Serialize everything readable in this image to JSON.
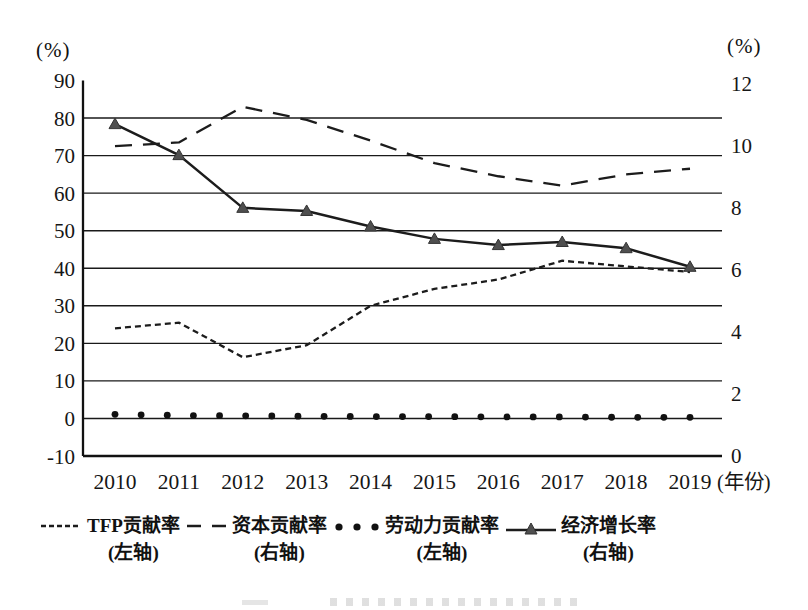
{
  "left_axis": {
    "unit": "(%)",
    "ticks": [
      90,
      80,
      70,
      60,
      50,
      40,
      30,
      20,
      10,
      0,
      -10
    ]
  },
  "right_axis": {
    "unit": "(%)",
    "ticks": [
      12,
      10,
      8,
      6,
      4,
      2,
      0
    ]
  },
  "x_axis": {
    "unit": "(年份)",
    "years": [
      2010,
      2011,
      2012,
      2013,
      2014,
      2015,
      2016,
      2017,
      2018,
      2019
    ]
  },
  "chart_data": {
    "type": "line",
    "x": [
      2010,
      2011,
      2012,
      2013,
      2014,
      2015,
      2016,
      2017,
      2018,
      2019
    ],
    "ylim_left": [
      -10,
      90
    ],
    "ylim_right": [
      0,
      12
    ],
    "grid": {
      "horizontal_lines_left_values": [
        0,
        10,
        20,
        30,
        40,
        50,
        60,
        70,
        80
      ]
    },
    "legend_position": "bottom",
    "series": [
      {
        "name": "TFP贡献率",
        "axis_label": "(左轴)",
        "line_style": "short-dash",
        "plotted_scale": "left",
        "values": [
          24,
          25.5,
          16.3,
          19.5,
          30,
          34.5,
          37,
          42,
          40.5,
          39
        ]
      },
      {
        "name": "资本贡献率",
        "axis_label": "(右轴)",
        "line_style": "long-dash",
        "plotted_scale": "left",
        "values": [
          72.5,
          73.5,
          83,
          79.5,
          74,
          68,
          64.5,
          62,
          65,
          66.5
        ]
      },
      {
        "name": "劳动力贡献率",
        "axis_label": "(左轴)",
        "line_style": "dots",
        "plotted_scale": "left",
        "values": [
          1.1,
          0.8,
          0.7,
          0.6,
          0.5,
          0.5,
          0.4,
          0.4,
          0.3,
          0.3
        ]
      },
      {
        "name": "经济增长率",
        "axis_label": "(右轴)",
        "line_style": "solid-triangle",
        "plotted_scale": "right",
        "values": [
          10.7,
          9.7,
          8.0,
          7.9,
          7.4,
          7.0,
          6.8,
          6.9,
          6.7,
          6.1
        ]
      }
    ]
  },
  "legend": {
    "items": [
      {
        "label": "TFP贡献率",
        "axis": "(左轴)",
        "marker": "short-dash-line"
      },
      {
        "label": "资本贡献率",
        "axis": "(右轴)",
        "marker": "long-dash-line"
      },
      {
        "label": "劳动力贡献率",
        "axis": "(左轴)",
        "marker": "three-dots"
      },
      {
        "label": "经济增长率",
        "axis": "(右轴)",
        "marker": "solid-line-with-triangle"
      }
    ]
  },
  "colors": {
    "line": "#1c1c1c",
    "triangle_fill": "#4f4f4f",
    "grid": "#1a1a1a"
  }
}
